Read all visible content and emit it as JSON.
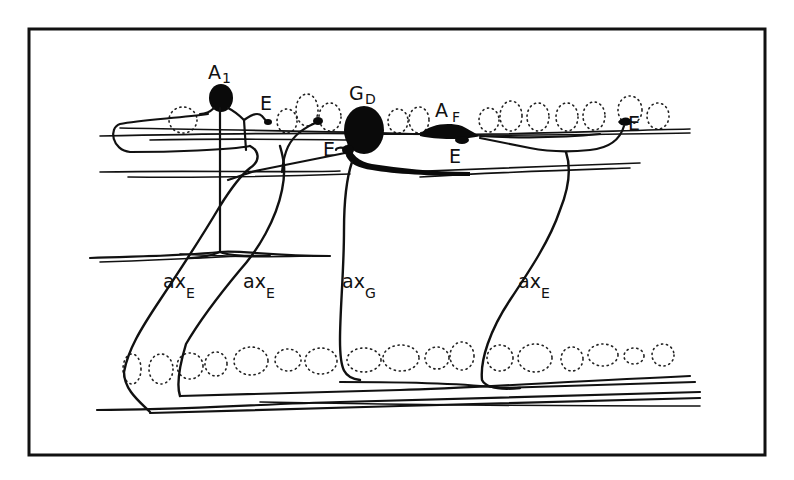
{
  "figure": {
    "type": "line-drawing",
    "colors": {
      "ink": "#111111",
      "background": "#ffffff"
    }
  },
  "labels": {
    "a1": {
      "main": "A",
      "sub": "1"
    },
    "gd": {
      "main": "G",
      "sub": "D"
    },
    "af": {
      "main": "A",
      "sub": "F"
    },
    "e_top_left": "E",
    "e_left_of_gd": "E",
    "e_below_af": "E",
    "e_right": "E",
    "ax_e_1": {
      "main": "ax",
      "sub": "E"
    },
    "ax_e_2": {
      "main": "ax",
      "sub": "E"
    },
    "ax_g": {
      "main": "ax",
      "sub": "G"
    },
    "ax_e_3": {
      "main": "ax",
      "sub": "E"
    }
  }
}
